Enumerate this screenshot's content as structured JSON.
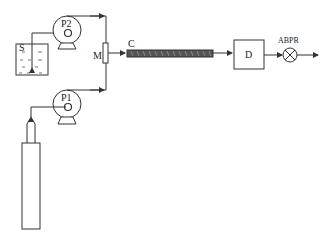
{
  "diagram": {
    "type": "process flow schematic",
    "components": {
      "solvent_reservoir": {
        "label": "S"
      },
      "pump_2": {
        "label": "P2"
      },
      "pump_1": {
        "label": "P1"
      },
      "mixer": {
        "label": "M"
      },
      "column": {
        "label": "C"
      },
      "detector": {
        "label": "D"
      },
      "back_pressure_regulator": {
        "label": "ABPR"
      },
      "gas_cylinder": {
        "label": ""
      }
    },
    "connections": [
      {
        "from": "S",
        "to": "P2"
      },
      {
        "from": "gas_cylinder",
        "to": "P1"
      },
      {
        "from": "P2",
        "to": "M"
      },
      {
        "from": "P1",
        "to": "M"
      },
      {
        "from": "M",
        "to": "C"
      },
      {
        "from": "C",
        "to": "D"
      },
      {
        "from": "D",
        "to": "ABPR"
      },
      {
        "from": "ABPR",
        "to": "outlet"
      }
    ],
    "colors": {
      "line": "#333333",
      "column_fill": "#555555",
      "background": "#ffffff"
    }
  }
}
